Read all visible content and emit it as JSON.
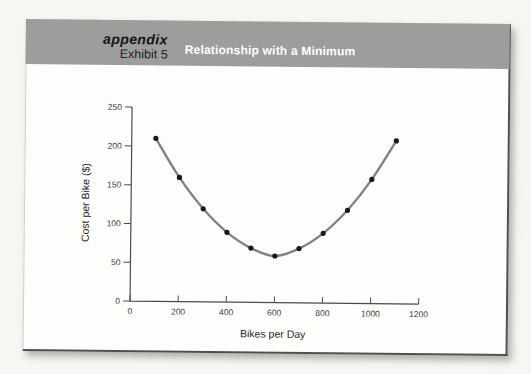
{
  "page": {
    "background_color": "#f7f6f2"
  },
  "exhibit": {
    "tag": "appendix",
    "label": "Exhibit 5",
    "title": "Relationship with a Minimum",
    "header_bg": "#9d9d9d",
    "title_color": "#ffffff"
  },
  "chart_data": {
    "type": "line",
    "title": "Relationship with a Minimum",
    "xlabel": "Bikes per Day",
    "ylabel": "Cost per Bike ($)",
    "x": [
      100,
      200,
      300,
      400,
      500,
      600,
      700,
      800,
      900,
      1000,
      1100
    ],
    "y": [
      210,
      160,
      120,
      90,
      70,
      60,
      70,
      90,
      120,
      160,
      210
    ],
    "xlim": [
      0,
      1200
    ],
    "ylim": [
      0,
      250
    ],
    "xticks": [
      0,
      200,
      400,
      600,
      800,
      1000,
      1200
    ],
    "yticks": [
      0,
      50,
      100,
      150,
      200,
      250
    ],
    "grid": false,
    "legend": false,
    "minimum_point": {
      "x": 600,
      "y": 60
    },
    "line_color": "#828282",
    "marker_color": "#181818",
    "axis_color": "#4a4a4a",
    "tick_color": "#3d3d3d"
  }
}
